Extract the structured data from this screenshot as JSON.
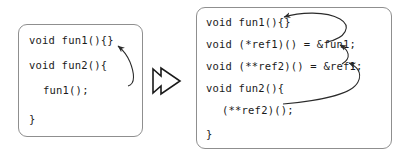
{
  "figure": {
    "ink_color": "#1a1a1a",
    "border_color": "#8f8f8f",
    "background_color": "#ffffff"
  },
  "transform_arrow": {
    "icon": "thick-right-arrow-icon",
    "label": "becomes"
  },
  "before_panel": {
    "name": "direct-call-code",
    "lines": [
      "void fun1(){}",
      "void fun2(){",
      "fun1();",
      "}"
    ]
  },
  "after_panel": {
    "name": "indirect-call-code",
    "lines": [
      "void fun1(){}",
      "void (*ref1)() = &fun1;",
      "void (**ref2)() = &ref1;",
      "void fun2(){",
      "(**ref2)();",
      "}"
    ]
  },
  "before_links": [
    {
      "name": "call-to-fun1-arrow",
      "from": "fun1();",
      "to": "void fun1(){}"
    }
  ],
  "after_links": [
    {
      "name": "ref1-to-fun1-arrow",
      "from": "&fun1;",
      "to": "void fun1(){}"
    },
    {
      "name": "ref2-to-ref1-arrow",
      "from": "&ref1;",
      "to": "(*ref1)()"
    },
    {
      "name": "call-to-ref2-arrow",
      "from": "(**ref2)();",
      "to": "(**ref2)()"
    }
  ]
}
